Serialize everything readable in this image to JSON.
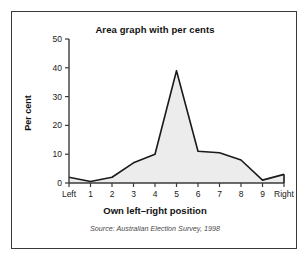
{
  "figure": {
    "title": "Area graph with per cents",
    "source": "Source: Australian Election Survey, 1998",
    "border_color": "#3a3a3a",
    "background": "#ffffff"
  },
  "chart_data": {
    "type": "area",
    "title": "Area graph with per cents",
    "xlabel": "Own left–right position",
    "ylabel": "Per cent",
    "categories": [
      "Left",
      "1",
      "2",
      "3",
      "4",
      "5",
      "6",
      "7",
      "8",
      "9",
      "Right"
    ],
    "values": [
      2,
      0.5,
      2,
      7,
      10,
      39,
      11,
      10.5,
      8,
      1,
      3
    ],
    "ylim": [
      0,
      50
    ],
    "yticks": [
      0,
      10,
      20,
      30,
      40,
      50
    ],
    "ytick_labels": [
      "0",
      "10",
      "20",
      "30",
      "40",
      "50"
    ],
    "grid": false,
    "legend": null,
    "line_color": "#1a1a1a",
    "fill_color": "#ececec",
    "source": "Source: Australian Election Survey, 1998"
  }
}
